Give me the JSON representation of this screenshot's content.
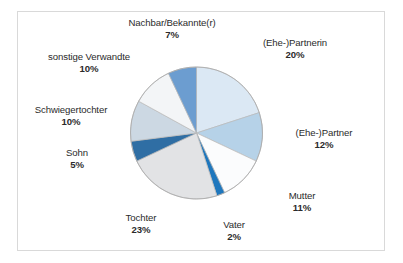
{
  "figure": {
    "background_color": "#ffffff",
    "border_color": "#d9d9d9"
  },
  "chart_data": {
    "type": "pie",
    "title": "",
    "subtitle": "",
    "xlabel": "",
    "ylabel": "",
    "legend_position": "none",
    "grid": false,
    "units": "%",
    "start_angle_deg": 0,
    "direction": "clockwise",
    "total": 100,
    "categories": [
      "(Ehe-)Partnerin",
      "(Ehe-)Partner",
      "Mutter",
      "Vater",
      "Tochter",
      "Sohn",
      "Schwiegertochter",
      "sonstige Verwandte",
      "Nachbar/Bekannte(r)"
    ],
    "values": [
      20,
      12,
      11,
      2,
      23,
      5,
      10,
      10,
      7
    ],
    "value_labels": [
      "20%",
      "12%",
      "11%",
      "2%",
      "23%",
      "5%",
      "10%",
      "10%",
      "7%"
    ],
    "colors": [
      "#dbe8f4",
      "#b6d2e8",
      "#fbfcfd",
      "#1f77bd",
      "#e2e3e5",
      "#2f6ea4",
      "#ccd8e3",
      "#f3f5f7",
      "#6c9dd0"
    ],
    "slice_edge_color": "#b9b9b9",
    "slices": [
      {
        "label": "(Ehe-)Partnerin",
        "value": 20,
        "value_label": "20%",
        "color": "#dbe8f4"
      },
      {
        "label": "(Ehe-)Partner",
        "value": 12,
        "value_label": "12%",
        "color": "#b6d2e8"
      },
      {
        "label": "Mutter",
        "value": 11,
        "value_label": "11%",
        "color": "#fbfcfd"
      },
      {
        "label": "Vater",
        "value": 2,
        "value_label": "2%",
        "color": "#1f77bd"
      },
      {
        "label": "Tochter",
        "value": 23,
        "value_label": "23%",
        "color": "#e2e3e5"
      },
      {
        "label": "Sohn",
        "value": 5,
        "value_label": "5%",
        "color": "#2f6ea4"
      },
      {
        "label": "Schwiegertochter",
        "value": 10,
        "value_label": "10%",
        "color": "#ccd8e3"
      },
      {
        "label": "sonstige Verwandte",
        "value": 10,
        "value_label": "10%",
        "color": "#f3f5f7"
      },
      {
        "label": "Nachbar/Bekannte(r)",
        "value": 7,
        "value_label": "7%",
        "color": "#6c9dd0"
      }
    ]
  }
}
